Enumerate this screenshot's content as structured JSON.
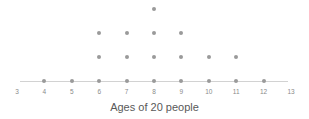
{
  "chart_data": {
    "type": "scatter",
    "plot_style": "dot-plot",
    "title": "",
    "xlabel": "Ages of 20 people",
    "ylabel": "",
    "categories": [
      3,
      4,
      5,
      6,
      7,
      8,
      9,
      10,
      11,
      12,
      13
    ],
    "tick_labels": [
      "3",
      "4",
      "5",
      "6",
      "7",
      "8",
      "9",
      "10",
      "11",
      "12",
      "13"
    ],
    "values": [
      0,
      1,
      1,
      3,
      3,
      4,
      3,
      2,
      2,
      1,
      0
    ],
    "total_count": 20,
    "xlim": [
      3,
      13
    ],
    "ylim": [
      0,
      4
    ],
    "grid": false,
    "legend": null,
    "dot_color": "#9a9a9a",
    "axis_color": "#d2d2d2",
    "label_color": "#8a8a8a",
    "caption_color": "#595959"
  },
  "caption": {
    "text": "Ages of 20 people"
  }
}
